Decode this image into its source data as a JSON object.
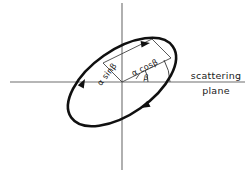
{
  "figure": {
    "background_color": "#ffffff",
    "axis_color": "#6e6e6e",
    "curve_color": "#101010",
    "construction_color": "#3a3a3a",
    "text_color": "#1a1a1a"
  },
  "axes": {
    "horizontal": {
      "name": "horizontal-axis",
      "x1": 10,
      "y1": 82,
      "x2": 245,
      "y2": 82
    },
    "vertical": {
      "name": "vertical-axis",
      "x1": 122,
      "y1": 3,
      "x2": 122,
      "y2": 170
    },
    "origin": {
      "x": 122,
      "y": 82
    }
  },
  "labels": {
    "plane_line1": "scattering",
    "plane_line2": "plane",
    "component_parallel": "α cosβ",
    "component_perpendicular": "α sinβ",
    "angle": "β"
  },
  "ellipse": {
    "name": "polarization-ellipse",
    "center_x": 122,
    "center_y": 82,
    "semi_major": 62,
    "semi_minor": 32,
    "rotation_deg": -35,
    "stroke_width": 2.6,
    "direction": "clockwise",
    "arrow_count": 3
  },
  "arrows": [
    {
      "name": "arrow-upper-right",
      "x": 146,
      "y": 44,
      "angle_deg": -12
    },
    {
      "name": "arrow-left",
      "x": 84,
      "y": 81,
      "angle_deg": -58
    },
    {
      "name": "arrow-lower-right",
      "x": 146,
      "y": 106,
      "angle_deg": 150
    }
  ],
  "construction": {
    "radial_vector": {
      "name": "radial-vector",
      "x1": 122,
      "y1": 82,
      "x2": 170,
      "y2": 58
    },
    "perpendicular_drop": {
      "name": "perpendicular-drop",
      "x1": 170,
      "y1": 58,
      "x2": 152,
      "y2": 40
    },
    "parallel_side": {
      "name": "parallel-side",
      "x1": 122,
      "y1": 82,
      "x2": 104,
      "y2": 64
    },
    "closing_side": {
      "name": "closing-side",
      "x1": 104,
      "y1": 64,
      "x2": 152,
      "y2": 40
    },
    "angle_arc_radius": 26
  }
}
